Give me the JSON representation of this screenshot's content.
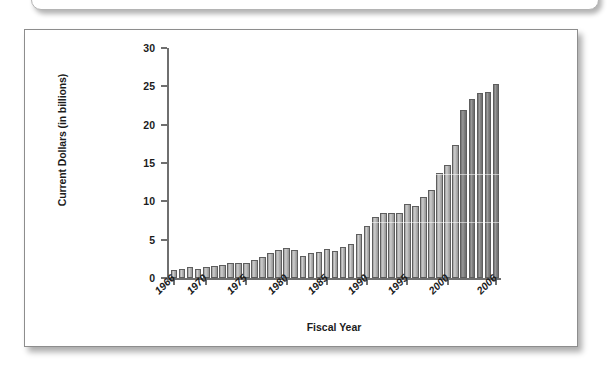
{
  "chart_data": {
    "type": "bar",
    "title": "",
    "xlabel": "Fiscal Year",
    "ylabel": "Current Dollars (in billions)",
    "ylim": [
      0,
      30
    ],
    "ytick_labels": [
      "0",
      "5",
      "10",
      "15",
      "20",
      "25",
      "30"
    ],
    "ytick_values": [
      0,
      5,
      10,
      15,
      20,
      25,
      30
    ],
    "xtick_labels": [
      "1966",
      "1970",
      "1975",
      "1980",
      "1985",
      "1990",
      "1995",
      "2000",
      "2006"
    ],
    "xtick_values": [
      1966,
      1970,
      1975,
      1980,
      1985,
      1990,
      1995,
      2000,
      2006
    ],
    "grid": false,
    "legend": "none",
    "categories": [
      "1966",
      "1967",
      "1968",
      "1969",
      "1970",
      "1971",
      "1972",
      "1973",
      "1974",
      "1975",
      "1976",
      "1977",
      "1978",
      "1979",
      "1980",
      "1981",
      "1982",
      "1983",
      "1984",
      "1985",
      "1986",
      "1987",
      "1988",
      "1989",
      "1990",
      "1991",
      "1992",
      "1993",
      "1994",
      "1995",
      "1996",
      "1997",
      "1998",
      "1999",
      "2000",
      "2001",
      "2002",
      "2003",
      "2004",
      "2005",
      "2006"
    ],
    "values": [
      1.0,
      1.2,
      1.4,
      1.2,
      1.5,
      1.6,
      1.7,
      2.0,
      1.9,
      2.0,
      2.3,
      2.8,
      3.2,
      3.7,
      3.9,
      3.6,
      2.9,
      3.2,
      3.4,
      3.8,
      3.5,
      4.1,
      4.5,
      5.8,
      6.8,
      7.9,
      8.5,
      8.5,
      8.5,
      9.7,
      9.4,
      10.6,
      11.5,
      13.7,
      14.8,
      17.3,
      21.9,
      23.4,
      24.1,
      24.3,
      25.3
    ],
    "series_shading": {
      "light_label": "enacted",
      "dark_label": "later years",
      "dark_from_index": 36,
      "light_color": "#b3b3b3",
      "dark_color": "#808080"
    }
  }
}
